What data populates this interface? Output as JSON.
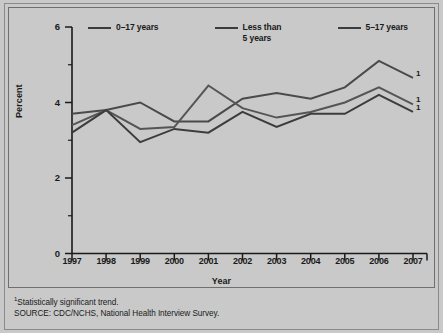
{
  "chart_data": {
    "type": "line",
    "title": "",
    "subtitle": "",
    "xlabel": "Year",
    "ylabel": "Percent",
    "x": [
      1997,
      1998,
      1999,
      2000,
      2001,
      2002,
      2003,
      2004,
      2005,
      2006,
      2007
    ],
    "categories": [
      "1997",
      "1998",
      "1999",
      "2000",
      "2001",
      "2002",
      "2003",
      "2004",
      "2005",
      "2006",
      "2007"
    ],
    "ylim": [
      0,
      6
    ],
    "yticks": [
      0,
      2,
      4,
      6
    ],
    "ytick_labels": [
      "0",
      "2",
      "4",
      "6"
    ],
    "y_minor_ticks": [
      1,
      3,
      5
    ],
    "grid": false,
    "legend_position": "top",
    "series": [
      {
        "name": "0–17 years",
        "color": "#4a4a4a",
        "values": [
          3.7,
          3.8,
          4.0,
          3.5,
          3.5,
          4.1,
          4.25,
          4.1,
          4.4,
          5.1,
          4.65
        ],
        "end_marker": "1"
      },
      {
        "name": "Less than\n5 years",
        "color": "#555555",
        "values": [
          3.4,
          3.8,
          3.3,
          3.35,
          4.45,
          3.85,
          3.6,
          3.75,
          4.0,
          4.4,
          3.95
        ],
        "end_marker": "1"
      },
      {
        "name": "5–17 years",
        "color": "#3c3c3c",
        "values": [
          3.2,
          3.8,
          2.95,
          3.3,
          3.2,
          3.75,
          3.35,
          3.7,
          3.7,
          4.2,
          3.75
        ],
        "end_marker": "1"
      }
    ],
    "annotations": [
      "¹Statistically significant trend.",
      "SOURCE: CDC/NCHS, National Health Interview Survey."
    ]
  },
  "legend": {
    "items": [
      {
        "label": "0–17 years"
      },
      {
        "label": "Less than\n5 years"
      },
      {
        "label": "5–17 years"
      }
    ]
  },
  "axes": {
    "y_label": "Percent",
    "x_label": "Year",
    "y_ticks": [
      "6",
      "4",
      "2",
      "0"
    ],
    "x_ticks": [
      "1997",
      "1998",
      "1999",
      "2000",
      "2001",
      "2002",
      "2003",
      "2004",
      "2005",
      "2006",
      "2007"
    ]
  },
  "endnote_markers": [
    "1",
    "1",
    "1"
  ],
  "footer": {
    "line1_marker": "1",
    "line1": "Statistically significant trend.",
    "line2": "SOURCE: CDC/NCHS, National Health Interview Survey."
  },
  "colors": {
    "background": "#c9c9c9",
    "frame": "#6f6f6f",
    "line": "#3c3c3c",
    "text": "#1a1a1a"
  }
}
